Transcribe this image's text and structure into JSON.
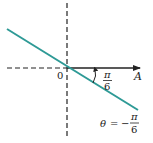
{
  "figure": {
    "origin_label": "0",
    "axis_label": "A",
    "angle_label": {
      "numerator": "π",
      "denominator": "6"
    },
    "equation": {
      "lhs": "θ",
      "equals": "=",
      "sign": "−",
      "numerator": "π",
      "denominator": "6"
    },
    "colors": {
      "line": "#2e9a96",
      "axis": "#222222",
      "background": "#ffffff"
    }
  }
}
